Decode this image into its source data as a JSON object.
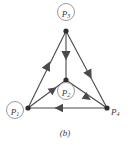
{
  "figure": {
    "caption": "(b)",
    "stroke_color": "#4a4a4a",
    "label_color": "#3b3b3b",
    "circle_color": "#9a9a9a",
    "background": "#ffffff"
  },
  "nodes": [
    {
      "id": "P1",
      "base": "P",
      "sub": "1",
      "circled": true,
      "x": 28,
      "y": 108,
      "label_x": 15,
      "label_y": 110
    },
    {
      "id": "P2",
      "base": "P",
      "sub": "2",
      "circled": true,
      "x": 66,
      "y": 80,
      "label_x": 66,
      "label_y": 91
    },
    {
      "id": "P3",
      "base": "P",
      "sub": "3",
      "circled": true,
      "x": 66,
      "y": 31,
      "label_x": 66,
      "label_y": 12
    },
    {
      "id": "P4",
      "base": "P",
      "sub": "4",
      "circled": false,
      "x": 107,
      "y": 108,
      "label_x": 117,
      "label_y": 108
    }
  ],
  "edges": [
    {
      "id": "e1",
      "from": "P1",
      "to": "P3",
      "arrow_position": "mid",
      "direction": "up-right"
    },
    {
      "id": "e2",
      "from": "P3",
      "to": "P2",
      "arrow_position": "mid",
      "direction": "down"
    },
    {
      "id": "e3",
      "from": "P3",
      "to": "P4",
      "arrow_position": "mid",
      "direction": "down-right"
    },
    {
      "id": "e4",
      "from": "P1",
      "to": "P2",
      "arrow_position": "mid",
      "direction": "up-right"
    },
    {
      "id": "e5",
      "from": "P2",
      "to": "P4",
      "arrow_position": "mid",
      "direction": "down-right"
    },
    {
      "id": "e6",
      "from": "P4",
      "to": "P1",
      "arrow_position": "mid",
      "direction": "left"
    }
  ]
}
